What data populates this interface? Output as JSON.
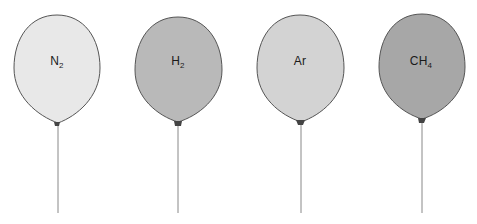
{
  "diagram": {
    "type": "gas-balloons",
    "balloons": [
      {
        "id": "n2",
        "formula_base": "N",
        "formula_sub": "2",
        "label": "N2",
        "fill": "#e8e8e8",
        "center_x": 57,
        "top_y": 15
      },
      {
        "id": "h2",
        "formula_base": "H",
        "formula_sub": "2",
        "label": "H2",
        "fill": "#b9b9b9",
        "center_x": 178,
        "top_y": 17
      },
      {
        "id": "ar",
        "formula_base": "Ar",
        "formula_sub": "",
        "label": "Ar",
        "fill": "#d3d3d3",
        "center_x": 300,
        "top_y": 15
      },
      {
        "id": "ch4",
        "formula_base": "CH",
        "formula_sub": "4",
        "label": "CH4",
        "fill": "#a7a7a7",
        "center_x": 422,
        "top_y": 14
      }
    ],
    "outline_color": "#555555",
    "string_color": "#888888",
    "string_bottom_y": 213
  }
}
